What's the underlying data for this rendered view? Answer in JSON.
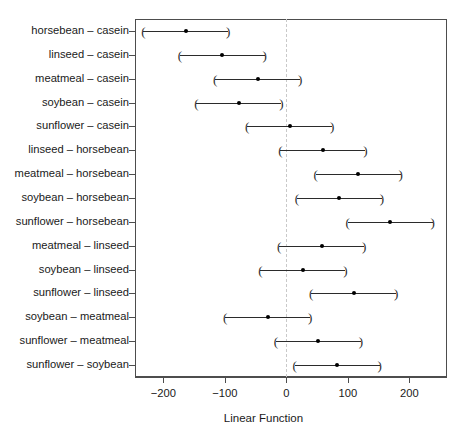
{
  "chart_data": {
    "type": "scatter",
    "title": "",
    "xlabel": "Linear Function",
    "ylabel": "",
    "xlim": [
      -246,
      261
    ],
    "xticks": [
      -200,
      -100,
      0,
      100,
      200
    ],
    "xticklabels": [
      "-200",
      "-100",
      "0",
      "100",
      "200"
    ],
    "grid": false,
    "legend": null,
    "reference_line": 0,
    "categories": [
      "horsebean - casein",
      "linseed - casein",
      "meatmeal - casein",
      "soybean - casein",
      "sunflower - casein",
      "linseed - horsebean",
      "meatmeal - horsebean",
      "soybean - horsebean",
      "sunflower - horsebean",
      "meatmeal - linseed",
      "soybean - linseed",
      "sunflower - linseed",
      "soybean - meatmeal",
      "sunflower - meatmeal",
      "sunflower - soybean"
    ],
    "estimates": [
      -163.4,
      -104.1,
      -46.7,
      -77.2,
      5.3,
      59.3,
      116.6,
      86.1,
      168.7,
      57.3,
      26.8,
      109.4,
      -30.5,
      52.1,
      82.6
    ],
    "lower": [
      -232.35,
      -173.0,
      -115.7,
      -146.2,
      -63.7,
      -9.7,
      47.6,
      17.1,
      99.7,
      -11.7,
      -42.2,
      40.4,
      -99.5,
      -16.9,
      13.6
    ],
    "upper": [
      -94.4,
      -35.2,
      22.3,
      -8.2,
      74.3,
      128.3,
      185.6,
      155.1,
      237.7,
      126.3,
      95.8,
      178.4,
      38.5,
      121.1,
      151.6
    ],
    "point_count": 15
  },
  "axis": {
    "x_title": "Linear Function",
    "tick_labels": [
      "-200",
      "-100",
      "0",
      "100",
      "200"
    ]
  },
  "series": {
    "name": "Tukey 95% family-wise confidence intervals",
    "cap_left": "(",
    "cap_right": ")"
  },
  "colors": {
    "axis": "#4d4d4d",
    "interval": "#2b2b2b",
    "point": "#000000",
    "reference": "#c9c9c9",
    "text": "#1a1a1a",
    "background": "#ffffff"
  }
}
